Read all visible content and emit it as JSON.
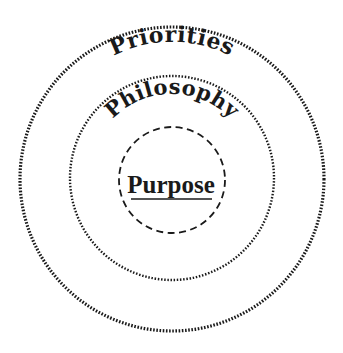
{
  "diagram": {
    "type": "concentric-circles",
    "rings": [
      {
        "id": "outer",
        "label": "Priorities",
        "border_style": "dotted-heavy",
        "cx": 172,
        "cy": 179,
        "r": 152
      },
      {
        "id": "middle",
        "label": "Philosophy",
        "border_style": "dotted",
        "cx": 172,
        "cy": 178,
        "r": 102
      },
      {
        "id": "inner",
        "label": "Purpose",
        "border_style": "dashed",
        "underlined": true,
        "cx": 172,
        "cy": 180,
        "r": 53
      }
    ],
    "colors": {
      "stroke": "#1a1a1a",
      "text": "#1a1a1a",
      "background": "#ffffff"
    }
  }
}
